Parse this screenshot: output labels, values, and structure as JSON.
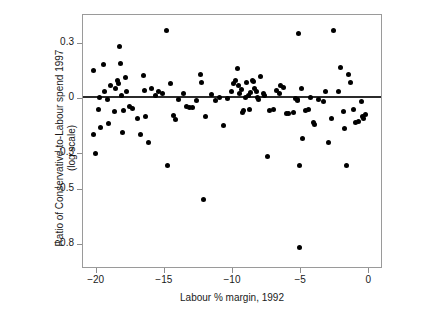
{
  "chart_data": {
    "type": "scatter",
    "title": "",
    "xlabel": "Labour % margin, 1992",
    "ylabel_line1": "Ratio of Conservative-to-Labour spend 1997",
    "ylabel_line2": "(log scale)",
    "xlim": [
      -21.0,
      1.0
    ],
    "ylim": [
      -0.93,
      0.46
    ],
    "xticks": [
      -20,
      -15,
      -10,
      -5,
      0
    ],
    "xticklabels": [
      "−20",
      "−15",
      "−10",
      "−5",
      "0"
    ],
    "yticks": [
      0.3,
      0,
      -0.3,
      -0.5,
      -0.8
    ],
    "yticklabels": [
      "0.3",
      "0",
      "−0.3",
      "−0.5",
      "−0.8"
    ],
    "grid": false,
    "legend": "none",
    "marker": "filled-circle",
    "marker_color": "#000000",
    "reference_line": {
      "type": "horizontal",
      "y": 0.012,
      "color": "#2b2b2b"
    },
    "points": [
      [
        -20.2,
        0.155
      ],
      [
        -20.2,
        -0.195
      ],
      [
        -20.1,
        -0.3
      ],
      [
        -19.9,
        -0.055
      ],
      [
        -19.8,
        0.008
      ],
      [
        -19.7,
        -0.155
      ],
      [
        -19.5,
        0.19
      ],
      [
        -19.4,
        0.04
      ],
      [
        -19.2,
        0.0
      ],
      [
        -19.1,
        -0.135
      ],
      [
        -19.0,
        0.075
      ],
      [
        -18.7,
        -0.07
      ],
      [
        -18.6,
        0.06
      ],
      [
        -18.5,
        0.1
      ],
      [
        -18.4,
        0.085
      ],
      [
        -18.3,
        0.285
      ],
      [
        -18.25,
        0.192
      ],
      [
        -18.2,
        0.022
      ],
      [
        -18.1,
        -0.185
      ],
      [
        -18.0,
        -0.06
      ],
      [
        -17.9,
        0.12
      ],
      [
        -17.8,
        0.04
      ],
      [
        -17.6,
        -0.038
      ],
      [
        -17.4,
        -0.05
      ],
      [
        -17.0,
        -0.105
      ],
      [
        -16.8,
        -0.195
      ],
      [
        -16.6,
        0.13
      ],
      [
        -16.5,
        0.048
      ],
      [
        -16.4,
        -0.095
      ],
      [
        -16.2,
        -0.235
      ],
      [
        -16.0,
        0.06
      ],
      [
        -15.7,
        0.02
      ],
      [
        -15.5,
        0.04
      ],
      [
        -15.2,
        0.032
      ],
      [
        -14.9,
        0.375
      ],
      [
        -14.8,
        -0.365
      ],
      [
        -14.6,
        0.085
      ],
      [
        -14.4,
        -0.09
      ],
      [
        -14.2,
        -0.11
      ],
      [
        -14.0,
        0.0
      ],
      [
        -13.6,
        0.03
      ],
      [
        -13.4,
        -0.04
      ],
      [
        -13.2,
        -0.045
      ],
      [
        -13.0,
        -0.048
      ],
      [
        -12.7,
        -0.01
      ],
      [
        -12.4,
        0.135
      ],
      [
        -12.3,
        0.09
      ],
      [
        -12.2,
        -0.55
      ],
      [
        -12.0,
        -0.095
      ],
      [
        -11.6,
        0.025
      ],
      [
        -11.3,
        -0.01
      ],
      [
        -11.0,
        0.01
      ],
      [
        -10.7,
        -0.145
      ],
      [
        -10.4,
        0.005
      ],
      [
        -10.1,
        0.04
      ],
      [
        -10.0,
        0.085
      ],
      [
        -9.8,
        0.1
      ],
      [
        -9.7,
        0.165
      ],
      [
        -9.6,
        0.072
      ],
      [
        -9.5,
        0.03
      ],
      [
        -9.4,
        0.055
      ],
      [
        -9.3,
        -0.075
      ],
      [
        -9.2,
        -0.06
      ],
      [
        -9.1,
        0.01
      ],
      [
        -9.0,
        0.09
      ],
      [
        -8.9,
        0.022
      ],
      [
        -8.8,
        -0.058
      ],
      [
        -8.7,
        0.035
      ],
      [
        -8.6,
        0.102
      ],
      [
        -8.5,
        0.098
      ],
      [
        -8.4,
        0.06
      ],
      [
        -8.3,
        0.04
      ],
      [
        -8.2,
        0.01
      ],
      [
        -8.1,
        0.0
      ],
      [
        -8.0,
        0.125
      ],
      [
        -7.8,
        0.03
      ],
      [
        -7.7,
        0.02
      ],
      [
        -7.5,
        -0.315
      ],
      [
        -7.3,
        -0.06
      ],
      [
        -7.0,
        -0.055
      ],
      [
        -6.8,
        0.045
      ],
      [
        -6.6,
        0.03
      ],
      [
        -6.5,
        0.075
      ],
      [
        -6.3,
        0.065
      ],
      [
        -6.1,
        -0.08
      ],
      [
        -5.9,
        -0.08
      ],
      [
        -5.6,
        -0.075
      ],
      [
        -5.4,
        0.005
      ],
      [
        -5.3,
        0.0
      ],
      [
        -5.25,
        -0.01
      ],
      [
        -5.2,
        0.36
      ],
      [
        -5.15,
        -0.365
      ],
      [
        -5.1,
        -0.81
      ],
      [
        -5.0,
        0.06
      ],
      [
        -4.9,
        -0.215
      ],
      [
        -4.7,
        -0.06
      ],
      [
        -4.5,
        -0.055
      ],
      [
        -4.3,
        0.008
      ],
      [
        -4.1,
        -0.13
      ],
      [
        -4.0,
        -0.14
      ],
      [
        -3.7,
        0.0
      ],
      [
        -3.4,
        -0.015
      ],
      [
        -3.2,
        0.04
      ],
      [
        -3.0,
        -0.24
      ],
      [
        -2.8,
        -0.105
      ],
      [
        -2.6,
        0.375
      ],
      [
        -2.3,
        0.04
      ],
      [
        -2.1,
        0.175
      ],
      [
        -1.9,
        -0.07
      ],
      [
        -1.8,
        -0.16
      ],
      [
        -1.7,
        -0.365
      ],
      [
        -1.5,
        0.135
      ],
      [
        -1.4,
        0.09
      ],
      [
        -1.2,
        -0.055
      ],
      [
        -1.0,
        -0.13
      ],
      [
        -0.8,
        -0.125
      ],
      [
        -0.6,
        -0.015
      ],
      [
        -0.5,
        -0.095
      ],
      [
        -0.4,
        -0.105
      ],
      [
        -0.3,
        -0.085
      ]
    ]
  }
}
